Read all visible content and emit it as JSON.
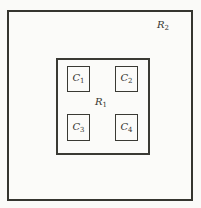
{
  "diagram": {
    "outer_region": {
      "label_main": "R",
      "label_sub": "2"
    },
    "inner_region": {
      "label_main": "R",
      "label_sub": "1"
    },
    "cells": [
      {
        "id": "c1",
        "label_main": "C",
        "label_sub": "1"
      },
      {
        "id": "c2",
        "label_main": "C",
        "label_sub": "2"
      },
      {
        "id": "c3",
        "label_main": "C",
        "label_sub": "3"
      },
      {
        "id": "c4",
        "label_main": "C",
        "label_sub": "4"
      }
    ],
    "colors": {
      "background": "#fafaf8",
      "line": "#35352f",
      "text": "#35352f"
    }
  }
}
